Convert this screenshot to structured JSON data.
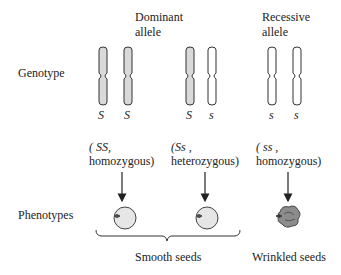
{
  "labels": {
    "dominant_line1": "Dominant",
    "dominant_line2": "allele",
    "recessive_line1": "Recessive",
    "recessive_line2": "allele",
    "genotype_row": "Genotype",
    "phenotype_row": "Phenotypes"
  },
  "genotypes": [
    {
      "alleles": [
        "S",
        "S"
      ],
      "fill": [
        "dominant",
        "dominant"
      ],
      "label_line1": "( SS,",
      "label_line2": "homozygous)",
      "phenotype": "smooth"
    },
    {
      "alleles": [
        "S",
        "s"
      ],
      "fill": [
        "dominant",
        "recessive"
      ],
      "label_line1": "(Ss ,",
      "label_line2": "heterozygous)",
      "phenotype": "smooth"
    },
    {
      "alleles": [
        "s",
        "s"
      ],
      "fill": [
        "recessive",
        "recessive"
      ],
      "label_line1": "( ss ,",
      "label_line2": "homozygous)",
      "phenotype": "wrinkled"
    }
  ],
  "phenotype_labels": {
    "smooth": "Smooth seeds",
    "wrinkled": "Wrinkled seeds"
  },
  "colors": {
    "dominant_fill": "#d9d9d9",
    "recessive_fill": "#ffffff",
    "outline": "#333333",
    "smooth_seed": "#e6e6e6",
    "wrinkled_seed": "#8c8c8c"
  }
}
